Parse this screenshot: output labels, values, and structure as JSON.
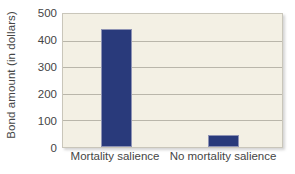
{
  "chart_data": {
    "type": "bar",
    "title": "",
    "xlabel": "",
    "ylabel": "Bond amount (in dollars)",
    "categories": [
      "Mortality salience",
      "No mortality salience"
    ],
    "values": [
      445,
      45
    ],
    "ylim": [
      0,
      500
    ],
    "yticks": [
      0,
      100,
      200,
      300,
      400,
      500
    ],
    "ytick_labels": [
      "0",
      "100",
      "200",
      "300",
      "400",
      "500"
    ],
    "gridlines": [
      100,
      200,
      300,
      400
    ],
    "grid": true,
    "legend": false,
    "legend_position": "none",
    "bar_color": "#293a7b",
    "plot_background_color": "#f3f0e4",
    "figure_background_color": "#ffffff",
    "gridline_color": "#b9b6aa",
    "axis_border_color": "#c9c6ba",
    "text_color": "#454545"
  }
}
